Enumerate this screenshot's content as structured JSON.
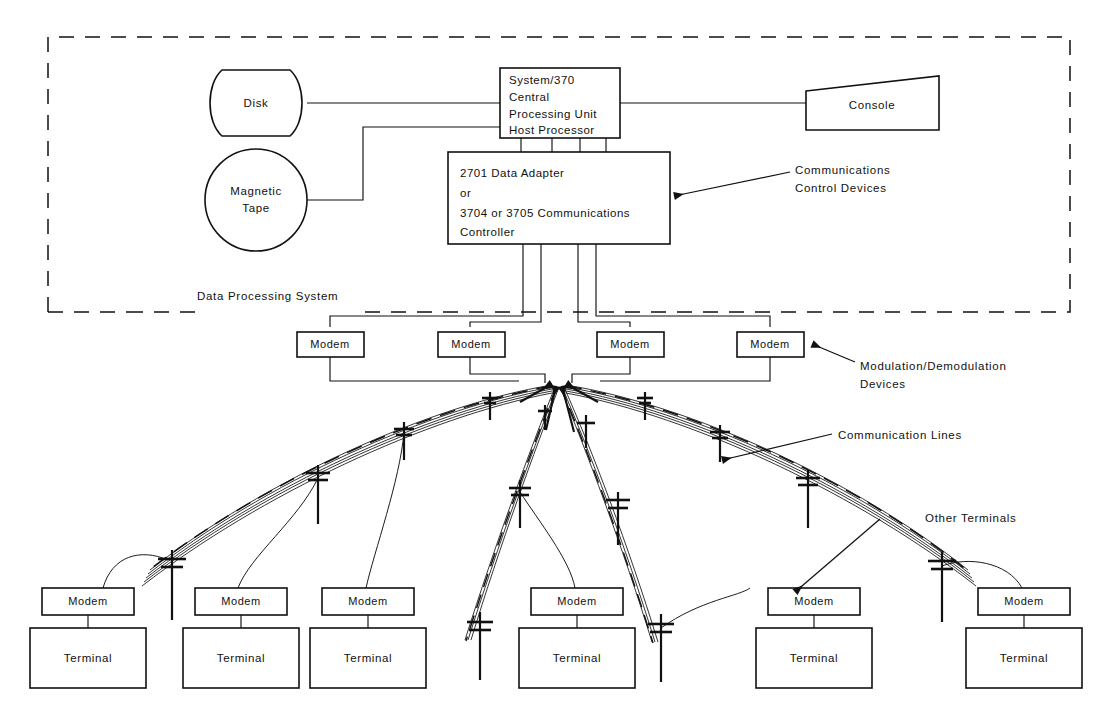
{
  "diagram": {
    "boundary_label": "Data Processing System",
    "ink_color": "#111111",
    "background_color": "#ffffff"
  },
  "host": {
    "disk": {
      "label": "Disk",
      "shape": "cylinder"
    },
    "tape": {
      "label_line1": "Magnetic",
      "label_line2": "Tape",
      "shape": "circle"
    },
    "cpu": {
      "line1": "System/370",
      "line2": "Central",
      "line3": "Processing Unit",
      "line4": "Host Processor",
      "shape": "rectangle"
    },
    "console": {
      "label": "Console",
      "shape": "trapezoid"
    },
    "controller": {
      "line1": "2701 Data Adapter",
      "line2": "or",
      "line3": "3704 or 3705 Communications",
      "line4": "Controller",
      "shape": "rectangle"
    }
  },
  "annotations": {
    "control_devices": {
      "line1": "Communications",
      "line2": "Control Devices"
    },
    "modulation": {
      "line1": "Modulation/Demodulation",
      "line2": "Devices"
    },
    "communication_lines": {
      "line1": "Communication Lines"
    },
    "other_terminals": {
      "line1": "Other Terminals"
    }
  },
  "labels": {
    "modem": "Modem",
    "terminal": "Terminal"
  },
  "upper_modems": [
    {
      "label": "Modem",
      "x": 297,
      "y": 335
    },
    {
      "label": "Modem",
      "x": 438,
      "y": 335
    },
    {
      "label": "Modem",
      "x": 597,
      "y": 335
    },
    {
      "label": "Modem",
      "x": 737,
      "y": 335
    }
  ],
  "terminal_stations": [
    {
      "modem": "Modem",
      "terminal": "Terminal",
      "x": 42,
      "modem_y": 590,
      "terminal_y": 625
    },
    {
      "modem": "Modem",
      "terminal": "Terminal",
      "x": 195,
      "modem_y": 590,
      "terminal_y": 625
    },
    {
      "modem": "Modem",
      "terminal": "Terminal",
      "x": 322,
      "modem_y": 590,
      "terminal_y": 625
    },
    {
      "modem": "Modem",
      "terminal": "Terminal",
      "x": 531,
      "modem_y": 590,
      "terminal_y": 625
    },
    {
      "modem": "Modem",
      "terminal": "Terminal",
      "x": 768,
      "modem_y": 590,
      "terminal_y": 625
    },
    {
      "modem": "Modem",
      "terminal": "Terminal",
      "x": 978,
      "modem_y": 590,
      "terminal_y": 625
    }
  ]
}
